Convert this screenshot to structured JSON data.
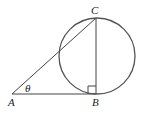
{
  "diagram": {
    "points": {
      "A": {
        "label": "A",
        "x": 12,
        "y": 94
      },
      "B": {
        "label": "B",
        "x": 96,
        "y": 94
      },
      "C": {
        "label": "C",
        "x": 96,
        "y": 18
      }
    },
    "angle_label": "θ",
    "circle": {
      "cx": 97,
      "cy": 56,
      "r": 38
    },
    "right_angle_at": "B",
    "stroke_color": "#444444"
  }
}
